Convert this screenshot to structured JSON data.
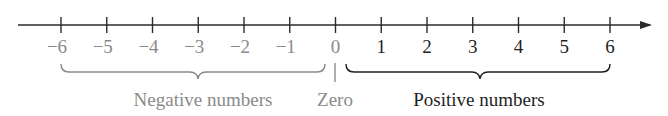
{
  "chart_data": {
    "type": "number_line",
    "title": "",
    "range": [
      -6,
      6
    ],
    "ticks": [
      -6,
      -5,
      -4,
      -3,
      -2,
      -1,
      0,
      1,
      2,
      3,
      4,
      5,
      6
    ],
    "tick_labels": [
      "−6",
      "−5",
      "−4",
      "−3",
      "−2",
      "−1",
      "0",
      "1",
      "2",
      "3",
      "4",
      "5",
      "6"
    ],
    "arrow": "right",
    "groups": [
      {
        "label": "Negative numbers",
        "from": -6,
        "to": -1,
        "color": "#8a8a8a"
      },
      {
        "label": "Zero",
        "at": 0,
        "color": "#8a8a8a"
      },
      {
        "label": "Positive numbers",
        "from": 1,
        "to": 6,
        "color": "#1f1f1f"
      }
    ]
  },
  "labels": {
    "negative": "Negative numbers",
    "zero": "Zero",
    "positive": "Positive numbers"
  },
  "colors": {
    "axis": "#2a2a2a",
    "negative": "#8a8a8a",
    "positive": "#1f1f1f",
    "background": "#ffffff"
  }
}
